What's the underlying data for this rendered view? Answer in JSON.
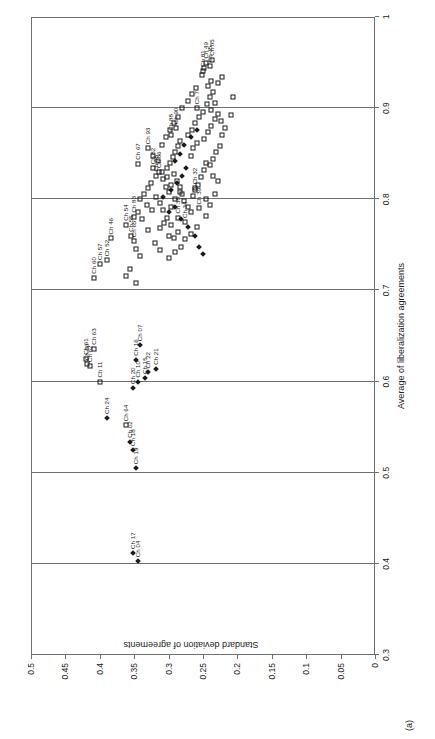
{
  "panel": {
    "label": "(a)"
  },
  "chart_data": {
    "type": "scatter",
    "title": "",
    "xlabel": "Average of liberalization agreements",
    "ylabel": "Standard deviation of agreements",
    "xlim": [
      0.3,
      1
    ],
    "ylim": [
      0,
      0.5
    ],
    "xticks": [
      "0.3",
      "0.4",
      "0.5",
      "0.6",
      "0.7",
      "0.8",
      "0.9",
      "1"
    ],
    "yticks": [
      "0",
      "0.05",
      "0.1",
      "0.15",
      "0.2",
      "0.25",
      "0.3",
      "0.35",
      "0.4",
      "0.45",
      "0.5"
    ],
    "grid": "vertical gridlines at each x tick",
    "legend": "none",
    "series": [
      {
        "name": "open-square",
        "marker": "square",
        "points": [
          {
            "label": "Ch 60",
            "x": 0.714,
            "y": 0.408
          },
          {
            "label": "Ch 57",
            "x": 0.729,
            "y": 0.399
          },
          {
            "label": "Ch 52",
            "x": 0.733,
            "y": 0.39
          },
          {
            "label": "Ch 46",
            "x": 0.757,
            "y": 0.383
          },
          {
            "label": "Ch 63",
            "x": 0.636,
            "y": 0.408
          },
          {
            "label": "Ch 61",
            "x": 0.625,
            "y": 0.42
          },
          {
            "label": "Ch 66",
            "x": 0.619,
            "y": 0.418
          },
          {
            "label": "Ch 62",
            "x": 0.617,
            "y": 0.414
          },
          {
            "label": "Ch 11",
            "x": 0.6,
            "y": 0.4
          },
          {
            "label": "Ch 64",
            "x": 0.552,
            "y": 0.362
          },
          {
            "label": "Ch 54",
            "x": 0.772,
            "y": 0.362
          },
          {
            "label": "Ch 55",
            "x": 0.76,
            "y": 0.354
          },
          {
            "label": "Ch 65",
            "x": 0.754,
            "y": 0.35
          },
          {
            "label": "Ch 83",
            "x": 0.781,
            "y": 0.35
          },
          {
            "label": "Ch 67",
            "x": 0.839,
            "y": 0.344
          },
          {
            "label": "Ch 93",
            "x": 0.856,
            "y": 0.33
          },
          {
            "label": "Ch 82",
            "x": 0.834,
            "y": 0.322
          },
          {
            "label": "Ch 86",
            "x": 0.83,
            "y": 0.314
          },
          {
            "label": "Ch 68",
            "x": 0.826,
            "y": 0.318
          },
          {
            "label": "Ch 88",
            "x": 0.871,
            "y": 0.296
          },
          {
            "label": "Ch 90",
            "x": 0.878,
            "y": 0.289
          },
          {
            "label": "Ch 32",
            "x": 0.812,
            "y": 0.262
          },
          {
            "label": "Ch 39",
            "x": 0.79,
            "y": 0.256
          },
          {
            "label": "Ch 7",
            "x": 0.9,
            "y": 0.258
          },
          {
            "label": "Ch 81",
            "x": 0.941,
            "y": 0.25
          },
          {
            "label": "Ch 49",
            "x": 0.95,
            "y": 0.245
          },
          {
            "label": "Ch 35",
            "x": 0.946,
            "y": 0.24
          },
          {
            "label": "Ch 85",
            "x": 0.953,
            "y": 0.237
          },
          {
            "label": "Ch 34",
            "x": 0.775,
            "y": 0.276
          },
          {
            "label": "Ch 38",
            "x": 0.78,
            "y": 0.287
          },
          {
            "label": "",
            "x": 0.8,
            "y": 0.341
          },
          {
            "label": "",
            "x": 0.806,
            "y": 0.336
          },
          {
            "label": "",
            "x": 0.794,
            "y": 0.332
          },
          {
            "label": "",
            "x": 0.812,
            "y": 0.33
          },
          {
            "label": "",
            "x": 0.818,
            "y": 0.326
          },
          {
            "label": "",
            "x": 0.788,
            "y": 0.324
          },
          {
            "label": "",
            "x": 0.802,
            "y": 0.318
          },
          {
            "label": "",
            "x": 0.796,
            "y": 0.312
          },
          {
            "label": "",
            "x": 0.822,
            "y": 0.308
          },
          {
            "label": "",
            "x": 0.814,
            "y": 0.304
          },
          {
            "label": "",
            "x": 0.808,
            "y": 0.3
          },
          {
            "label": "",
            "x": 0.834,
            "y": 0.303
          },
          {
            "label": "",
            "x": 0.84,
            "y": 0.298
          },
          {
            "label": "",
            "x": 0.846,
            "y": 0.294
          },
          {
            "label": "",
            "x": 0.852,
            "y": 0.29
          },
          {
            "label": "",
            "x": 0.858,
            "y": 0.287
          },
          {
            "label": "",
            "x": 0.864,
            "y": 0.283
          },
          {
            "label": "",
            "x": 0.828,
            "y": 0.292
          },
          {
            "label": "",
            "x": 0.82,
            "y": 0.288
          },
          {
            "label": "",
            "x": 0.814,
            "y": 0.284
          },
          {
            "label": "",
            "x": 0.806,
            "y": 0.281
          },
          {
            "label": "",
            "x": 0.798,
            "y": 0.277
          },
          {
            "label": "",
            "x": 0.792,
            "y": 0.272
          },
          {
            "label": "",
            "x": 0.786,
            "y": 0.268
          },
          {
            "label": "",
            "x": 0.804,
            "y": 0.265
          },
          {
            "label": "",
            "x": 0.81,
            "y": 0.261
          },
          {
            "label": "",
            "x": 0.816,
            "y": 0.257
          },
          {
            "label": "",
            "x": 0.824,
            "y": 0.253
          },
          {
            "label": "",
            "x": 0.832,
            "y": 0.249
          },
          {
            "label": "",
            "x": 0.84,
            "y": 0.246
          },
          {
            "label": "",
            "x": 0.848,
            "y": 0.268
          },
          {
            "label": "",
            "x": 0.856,
            "y": 0.264
          },
          {
            "label": "",
            "x": 0.862,
            "y": 0.259
          },
          {
            "label": "",
            "x": 0.87,
            "y": 0.272
          },
          {
            "label": "",
            "x": 0.876,
            "y": 0.266
          },
          {
            "label": "",
            "x": 0.884,
            "y": 0.262
          },
          {
            "label": "",
            "x": 0.89,
            "y": 0.256
          },
          {
            "label": "",
            "x": 0.896,
            "y": 0.25
          },
          {
            "label": "",
            "x": 0.904,
            "y": 0.244
          },
          {
            "label": "",
            "x": 0.912,
            "y": 0.24
          },
          {
            "label": "",
            "x": 0.918,
            "y": 0.235
          },
          {
            "label": "",
            "x": 0.924,
            "y": 0.243
          },
          {
            "label": "",
            "x": 0.93,
            "y": 0.238
          },
          {
            "label": "",
            "x": 0.866,
            "y": 0.248
          },
          {
            "label": "",
            "x": 0.874,
            "y": 0.243
          },
          {
            "label": "",
            "x": 0.88,
            "y": 0.238
          },
          {
            "label": "",
            "x": 0.888,
            "y": 0.232
          },
          {
            "label": "",
            "x": 0.894,
            "y": 0.228
          },
          {
            "label": "",
            "x": 0.844,
            "y": 0.235
          },
          {
            "label": "",
            "x": 0.852,
            "y": 0.231
          },
          {
            "label": "",
            "x": 0.838,
            "y": 0.24
          },
          {
            "label": "",
            "x": 0.826,
            "y": 0.236
          },
          {
            "label": "",
            "x": 0.8,
            "y": 0.246
          },
          {
            "label": "",
            "x": 0.794,
            "y": 0.24
          },
          {
            "label": "",
            "x": 0.782,
            "y": 0.246
          },
          {
            "label": "",
            "x": 0.77,
            "y": 0.258
          },
          {
            "label": "",
            "x": 0.762,
            "y": 0.268
          },
          {
            "label": "",
            "x": 0.756,
            "y": 0.276
          },
          {
            "label": "",
            "x": 0.748,
            "y": 0.282
          },
          {
            "label": "",
            "x": 0.742,
            "y": 0.29
          },
          {
            "label": "",
            "x": 0.736,
            "y": 0.3
          },
          {
            "label": "",
            "x": 0.744,
            "y": 0.312
          },
          {
            "label": "",
            "x": 0.752,
            "y": 0.32
          },
          {
            "label": "",
            "x": 0.766,
            "y": 0.33
          },
          {
            "label": "",
            "x": 0.778,
            "y": 0.338
          },
          {
            "label": "",
            "x": 0.786,
            "y": 0.345
          },
          {
            "label": "",
            "x": 0.768,
            "y": 0.312
          },
          {
            "label": "",
            "x": 0.774,
            "y": 0.306
          },
          {
            "label": "",
            "x": 0.76,
            "y": 0.3
          },
          {
            "label": "",
            "x": 0.758,
            "y": 0.292
          },
          {
            "label": "",
            "x": 0.764,
            "y": 0.286
          },
          {
            "label": "",
            "x": 0.772,
            "y": 0.296
          },
          {
            "label": "",
            "x": 0.78,
            "y": 0.302
          },
          {
            "label": "",
            "x": 0.788,
            "y": 0.308
          },
          {
            "label": "",
            "x": 0.792,
            "y": 0.296
          },
          {
            "label": "",
            "x": 0.8,
            "y": 0.29
          },
          {
            "label": "",
            "x": 0.808,
            "y": 0.284
          },
          {
            "label": "",
            "x": 0.816,
            "y": 0.296
          },
          {
            "label": "",
            "x": 0.824,
            "y": 0.302
          },
          {
            "label": "",
            "x": 0.83,
            "y": 0.31
          },
          {
            "label": "",
            "x": 0.842,
            "y": 0.316
          },
          {
            "label": "",
            "x": 0.848,
            "y": 0.322
          },
          {
            "label": "",
            "x": 0.86,
            "y": 0.31
          },
          {
            "label": "",
            "x": 0.868,
            "y": 0.304
          },
          {
            "label": "",
            "x": 0.876,
            "y": 0.298
          },
          {
            "label": "",
            "x": 0.884,
            "y": 0.292
          },
          {
            "label": "",
            "x": 0.89,
            "y": 0.286
          },
          {
            "label": "",
            "x": 0.9,
            "y": 0.28
          },
          {
            "label": "",
            "x": 0.908,
            "y": 0.272
          },
          {
            "label": "",
            "x": 0.916,
            "y": 0.266
          },
          {
            "label": "",
            "x": 0.922,
            "y": 0.26
          },
          {
            "label": "",
            "x": 0.936,
            "y": 0.252
          },
          {
            "label": "",
            "x": 0.944,
            "y": 0.248
          },
          {
            "label": "",
            "x": 0.928,
            "y": 0.228
          },
          {
            "label": "",
            "x": 0.934,
            "y": 0.222
          },
          {
            "label": "",
            "x": 0.906,
            "y": 0.232
          },
          {
            "label": "",
            "x": 0.898,
            "y": 0.238
          },
          {
            "label": "",
            "x": 0.886,
            "y": 0.224
          },
          {
            "label": "",
            "x": 0.878,
            "y": 0.218
          },
          {
            "label": "",
            "x": 0.87,
            "y": 0.222
          },
          {
            "label": "",
            "x": 0.858,
            "y": 0.226
          },
          {
            "label": "",
            "x": 0.82,
            "y": 0.228
          },
          {
            "label": "",
            "x": 0.806,
            "y": 0.232
          },
          {
            "label": "",
            "x": 0.892,
            "y": 0.21
          },
          {
            "label": "",
            "x": 0.912,
            "y": 0.206
          },
          {
            "label": "",
            "x": 0.746,
            "y": 0.348
          },
          {
            "label": "",
            "x": 0.738,
            "y": 0.342
          },
          {
            "label": "",
            "x": 0.724,
            "y": 0.356
          },
          {
            "label": "",
            "x": 0.716,
            "y": 0.362
          },
          {
            "label": "",
            "x": 0.708,
            "y": 0.348
          }
        ]
      },
      {
        "name": "filled-diamond",
        "marker": "diamond",
        "points": [
          {
            "label": "Ch 04",
            "x": 0.403,
            "y": 0.345
          },
          {
            "label": "Ch 17",
            "x": 0.412,
            "y": 0.352
          },
          {
            "label": "Ch 19",
            "x": 0.505,
            "y": 0.347
          },
          {
            "label": "Ch 18",
            "x": 0.525,
            "y": 0.352
          },
          {
            "label": "Ch 02",
            "x": 0.534,
            "y": 0.356
          },
          {
            "label": "Ch 24",
            "x": 0.56,
            "y": 0.39
          },
          {
            "label": "Ch 20",
            "x": 0.593,
            "y": 0.352
          },
          {
            "label": "Ch 10",
            "x": 0.6,
            "y": 0.344
          },
          {
            "label": "Ch 15",
            "x": 0.604,
            "y": 0.335
          },
          {
            "label": "Ch 22",
            "x": 0.61,
            "y": 0.33
          },
          {
            "label": "Ch 21",
            "x": 0.614,
            "y": 0.318
          },
          {
            "label": "Ch 16",
            "x": 0.624,
            "y": 0.348
          },
          {
            "label": "Ch 07",
            "x": 0.64,
            "y": 0.342
          },
          {
            "label": "",
            "x": 0.786,
            "y": 0.3
          },
          {
            "label": "",
            "x": 0.792,
            "y": 0.29
          },
          {
            "label": "",
            "x": 0.778,
            "y": 0.282
          },
          {
            "label": "",
            "x": 0.77,
            "y": 0.272
          },
          {
            "label": "",
            "x": 0.76,
            "y": 0.262
          },
          {
            "label": "",
            "x": 0.802,
            "y": 0.308
          },
          {
            "label": "",
            "x": 0.81,
            "y": 0.296
          },
          {
            "label": "",
            "x": 0.818,
            "y": 0.288
          },
          {
            "label": "",
            "x": 0.826,
            "y": 0.28
          },
          {
            "label": "",
            "x": 0.834,
            "y": 0.274
          },
          {
            "label": "",
            "x": 0.842,
            "y": 0.29
          },
          {
            "label": "",
            "x": 0.85,
            "y": 0.284
          },
          {
            "label": "",
            "x": 0.748,
            "y": 0.256
          },
          {
            "label": "",
            "x": 0.74,
            "y": 0.25
          },
          {
            "label": "",
            "x": 0.86,
            "y": 0.278
          },
          {
            "label": "",
            "x": 0.868,
            "y": 0.268
          },
          {
            "label": "",
            "x": 0.876,
            "y": 0.258
          }
        ]
      }
    ]
  }
}
